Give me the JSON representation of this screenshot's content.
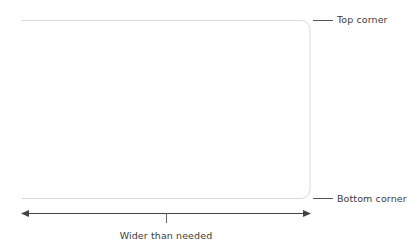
{
  "diagram": {
    "background_color": "#ffffff",
    "shape": {
      "name": "rounded-rectangle",
      "stroke_color": "#d9d9d9",
      "stroke_width": 1,
      "corner_radius": 9,
      "left": 22,
      "right": 310,
      "top": 20,
      "bottom": 199,
      "left_edge_visible": false,
      "note": "Shape runs off the left side of the frame; only top, right and bottom edges are drawn."
    },
    "callouts": [
      {
        "id": "top-corner",
        "label": "Top corner",
        "leader_color": "#555555",
        "leader_x1": 313,
        "leader_x2": 333,
        "leader_y": 20,
        "label_x": 337,
        "label_y": 20
      },
      {
        "id": "bottom-corner",
        "label": "Bottom corner",
        "leader_color": "#555555",
        "leader_x1": 313,
        "leader_x2": 333,
        "leader_y": 199,
        "label_x": 337,
        "label_y": 199
      }
    ],
    "measurement": {
      "id": "width-measure",
      "caption": "Wider than needed",
      "line_color": "#444444",
      "line_width": 1,
      "y": 213,
      "x_start": 22,
      "x_end": 310,
      "arrowhead_start": true,
      "arrowhead_end": true,
      "arrowhead_size": 4,
      "midpoint_tick": {
        "x": 166,
        "y_top": 213,
        "y_bottom": 223,
        "color": "#666666"
      },
      "caption_x": 166,
      "caption_y": 236
    },
    "colors": {
      "shape_stroke": "#d9d9d9",
      "leader_line": "#555555",
      "measure_line": "#444444",
      "text": "#3b3b3b",
      "background": "#ffffff"
    }
  }
}
